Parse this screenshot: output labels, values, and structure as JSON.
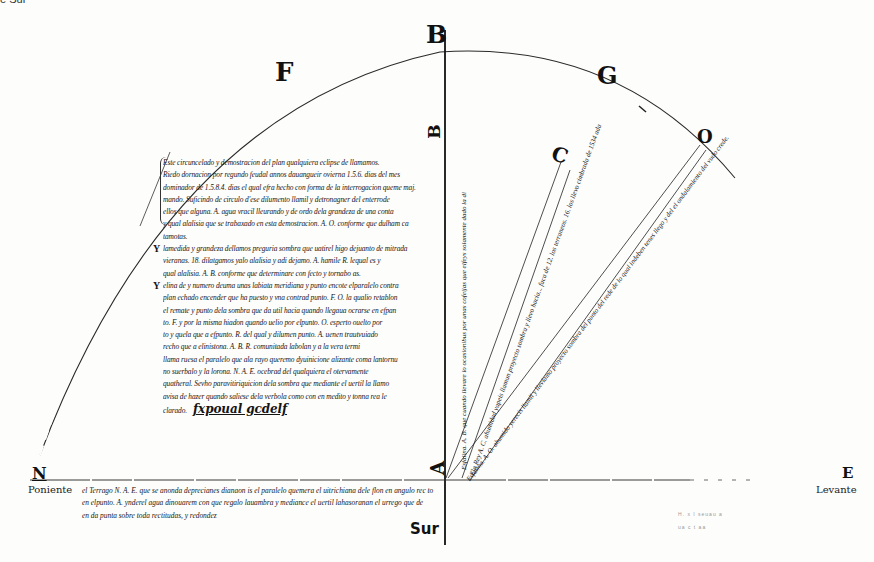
{
  "page": {
    "top_cut_text": "e Sur"
  },
  "figure": {
    "arc_labels": {
      "F": "F",
      "B_top": "B",
      "G": "G",
      "O": "O",
      "C": "C",
      "B_mid": "B",
      "A": "A"
    },
    "cardinal": {
      "north_letter": "N",
      "north_word": "Poniente",
      "east_letter": "E",
      "east_word": "Levante",
      "south_word": "Sur"
    },
    "line_annotations": {
      "vertical_line": "Esfalina. A. B. que cuando llevare lo ocasionibus por unas cofeijas que elfeys solamente dado la di",
      "line_ac": "Ela Rey A. C. ahumidad yapeis llamun proyecto sombra y llevo hacia... faca de 12. los terraneos. 16. los llevo cimbrada de 1534 ada",
      "line_ao": "Esfalina. A. O. ahumido yerecis llamil y llevlamo proyecto sombra del punto del rede de lo qual indeben tenes llego y del el ondalamiento del vudo crede."
    }
  },
  "manuscript": {
    "para1": [
      "Este circuncelado y demostracion del plan qualquiera eclipse de llamamos.",
      "Riedo dornacion por regundo feudal annos dauangueir ovierna 1.5.6. dias del mes",
      "dominador de 1.5.8.4. dias el qual efra hecho con forma de la interrogacion queme maj.",
      "mando. Suficindo de circulo d'ese dilumento llamil y detronagner del enterrode",
      "ellos que alguna. A. agua vracil lleurando y de ordo dela grandeza de una conta",
      "y qual alalisia que se trabaxado en esta demostracion. A. O. conforme que dulham ca",
      "tamotas."
    ],
    "para2": [
      "lamedida y grandeza dellamos preguria sombra que uatirel higo dejuanto de mitrada",
      "vieranas. 18. dilatgamos yalo alalisia y adi dejamo. A. hamile R. lequal es y",
      "qual alalisia. A. B. conforme que determinare con fecto y tornabo as."
    ],
    "para3": [
      "elina de y numero deuma unas labiata meridiana y punto encote elparalelo contra",
      "plan echado encender que ha puesto y vna contrad punto. F. O. la qualio retablon",
      "el remate y punto dela sombra que da util hacia quando llegaua ocrarse en efpan",
      "to. F. y por la misma hiadon quando uelio por elpunto. O. esperto ouelto por",
      "to y quela que a efpunto. R. del qual y dilumen punto. A. uenen trautvuiado",
      "recho que a elinistona. A. B. R. comunitada labolan y a la vera termi",
      "llama ruesa el paralelo que ala rayo queremo dyuinicione alizante coma lantornu",
      "no suerbalo y la lorona. N. A. E. ocebrad del qualquiera el otervamente",
      "quatheral. Sevho paravitiriquicion dela sombra que mediante el uertil la llamo",
      "avisa de hazer quando saliese dela verbola como con en medito y tonna rea le",
      "clarado."
    ],
    "signature": "fxpoual gcdelf"
  },
  "bottom_note": {
    "lines": [
      "el Terrago N. A. E. que se anonda deprecianes dianaon is el paralelo quemera el uitrichiana dele flon en angulo rec to",
      "en elpunto. A. ynderel agua dinouarem con que regalo lauambra y mediance el uertil lahasoranan el urrego que de",
      "en da punta sobre toda rectitudas, y redondez"
    ],
    "big_tokens": [
      "N.",
      "A.",
      "E",
      "A."
    ]
  },
  "faint_marks": {
    "line1": "H. x I  seuau  a",
    "line2": "ua  c   t    aa"
  }
}
